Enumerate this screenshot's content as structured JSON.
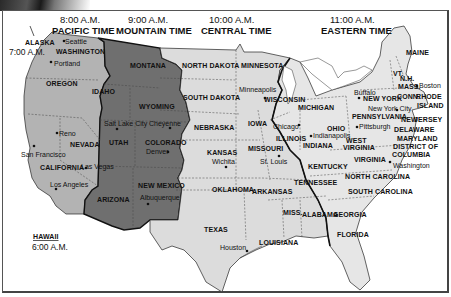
{
  "colors": {
    "pacific": "#b3b3b3",
    "mountain": "#6f6f6f",
    "central": "#dcdcdc",
    "eastern": "#e6e6e6",
    "zone_border": "#111111",
    "background": "#ffffff"
  },
  "time_zones": [
    {
      "id": "pacific",
      "time": "8:00 A.M.",
      "name": "PACIFIC TIME"
    },
    {
      "id": "mountain",
      "time": "9:00 A.M.",
      "name": "MOUNTAIN TIME"
    },
    {
      "id": "central",
      "time": "10:00 A.M.",
      "name": "CENTRAL TIME"
    },
    {
      "id": "eastern",
      "time": "11:00 A.M.",
      "name": "EASTERN TIME"
    }
  ],
  "insets": {
    "alaska": {
      "label": "ALASKA",
      "time": "7:00 A.M."
    },
    "hawaii": {
      "label": "HAWAII",
      "time": "6:00 A.M."
    }
  },
  "states": {
    "washington": "WASHINGTON",
    "oregon": "OREGON",
    "california": "CALIFORNIA",
    "nevada": "NEVADA",
    "idaho": "IDAHO",
    "montana": "MONTANA",
    "wyoming": "WYOMING",
    "utah": "UTAH",
    "colorado": "COLORADO",
    "arizona": "ARIZONA",
    "new_mexico": "NEW MEXICO",
    "north_dakota": "NORTH DAKOTA",
    "south_dakota": "SOUTH DAKOTA",
    "nebraska": "NEBRASKA",
    "kansas": "KANSAS",
    "oklahoma": "OKLAHOMA",
    "texas": "TEXAS",
    "minnesota": "MINNESOTA",
    "iowa": "IOWA",
    "missouri": "MISSOURI",
    "arkansas": "ARKANSAS",
    "louisiana": "LOUISIANA",
    "wisconsin": "WISCONSIN",
    "illinois": "ILLINOIS",
    "michigan": "MICHIGAN",
    "indiana": "INDIANA",
    "ohio": "OHIO",
    "kentucky": "KENTUCKY",
    "tennessee": "TENNESSEE",
    "mississippi": "MISS.",
    "alabama": "ALABAMA",
    "georgia": "GEORGIA",
    "florida": "FLORIDA",
    "south_carolina": "SOUTH CAROLINA",
    "north_carolina": "NORTH CAROLINA",
    "virginia": "VIRGINIA",
    "west_virginia_1": "WEST",
    "west_virginia_2": "VIRGINIA",
    "pennsylvania": "PENNSYLVANIA",
    "new_york": "NEW YORK",
    "maine": "MAINE",
    "vermont": "VT.",
    "new_hampshire": "N.H.",
    "massachusetts": "MASS.",
    "connecticut": "CONN.",
    "rhode_island_1": "RHODE",
    "rhode_island_2": "ISLAND",
    "new_jersey_1": "NEW",
    "new_jersey_2": "JERSEY",
    "delaware": "DELAWARE",
    "maryland": "MARYLAND",
    "dc_1": "DISTRICT OF",
    "dc_2": "COLUMBIA"
  },
  "cities": {
    "seattle": "Seattle",
    "portland": "Portland",
    "reno": "Reno",
    "san_francisco": "San Francisco",
    "las_vegas": "Las Vegas",
    "los_angeles": "Los Angeles",
    "salt_lake_city": "Salt Lake City",
    "cheyenne": "Cheyenne",
    "denver": "Denver",
    "albuquerque": "Albuquerque",
    "minneapolis": "Minneapolis",
    "wichita": "Wichita",
    "st_louis": "St. Louis",
    "chicago": "Chicago",
    "houston": "Houston",
    "indianapolis": "Indianapolis",
    "pittsburgh": "Pittsburgh",
    "buffalo": "Buffalo",
    "new_york_city": "New York City",
    "boston": "Boston",
    "washington_dc": "Washington"
  }
}
